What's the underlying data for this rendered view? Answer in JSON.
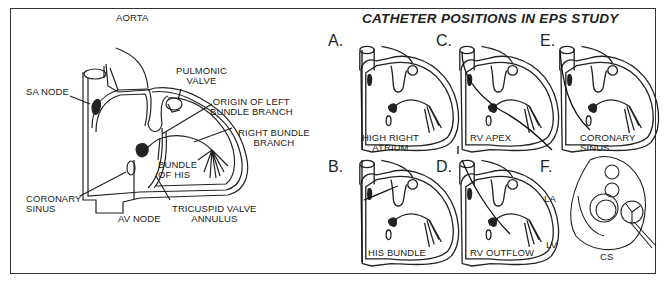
{
  "figure": {
    "title": "CATHETER POSITIONS IN EPS STUDY",
    "main_diagram": {
      "labels": {
        "aorta": "AORTA",
        "pulmonic_valve": "PULMONIC\nVALVE",
        "sa_node": "SA NODE",
        "origin_left_bundle": "ORIGIN OF LEFT\nBUNDLE BRANCH",
        "right_bundle": "RIGHT BUNDLE\nBRANCH",
        "bundle_of_his": "BUNDLE\nOF HIS",
        "coronary_sinus": "CORONARY\nSINUS",
        "av_node": "AV NODE",
        "tricuspid_annulus": "TRICUSPID VALVE\nANNULUS"
      }
    },
    "panels": [
      {
        "letter": "A.",
        "label": "HIGH RIGHT\nATRIUM"
      },
      {
        "letter": "B.",
        "label": "HIS BUNDLE"
      },
      {
        "letter": "C.",
        "label": "RV APEX"
      },
      {
        "letter": "D.",
        "label": "RV OUTFLOW"
      },
      {
        "letter": "E.",
        "label": "CORONARY\nSINUS"
      },
      {
        "letter": "F.",
        "label_la": "LA",
        "label_lv": "LV",
        "label_cs": "CS"
      }
    ]
  }
}
